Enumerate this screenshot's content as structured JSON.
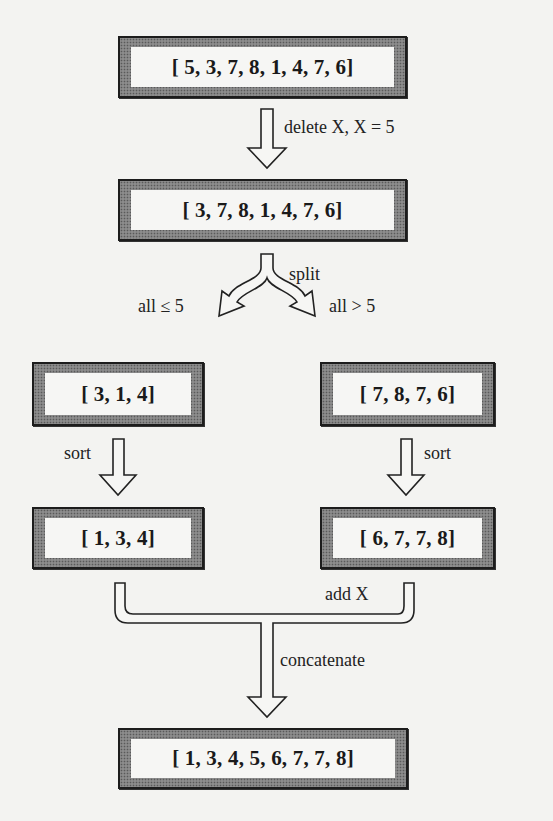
{
  "diagram": {
    "nodes": {
      "input": "[ 5, 3, 7, 8, 1, 4, 7, 6]",
      "after_delete": "[ 3, 7, 8, 1, 4, 7, 6]",
      "left_split": "[ 3, 1, 4]",
      "right_split": "[ 7, 8, 7, 6]",
      "left_sorted": "[ 1, 3, 4]",
      "right_sorted": "[ 6, 7, 7, 8]",
      "result": "[ 1, 3, 4, 5, 6, 7, 7, 8]"
    },
    "edges": {
      "delete": "delete X,  X = 5",
      "split": "split",
      "left_condition": "all ≤ 5",
      "right_condition": "all > 5",
      "sort_left": "sort",
      "sort_right": "sort",
      "add_x": "add X",
      "concatenate": "concatenate"
    }
  }
}
